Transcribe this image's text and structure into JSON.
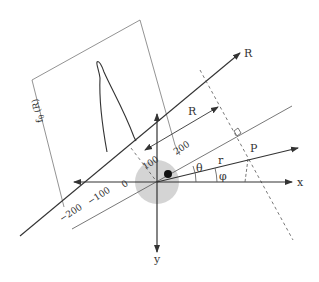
{
  "diagram": {
    "axes": {
      "x_label": "x",
      "y_label": "y",
      "R_label": "R"
    },
    "inset_plot": {
      "ylabel": "f_θ (R)",
      "ylabel_main": "f",
      "ylabel_sub": "θ",
      "ylabel_arg": " (R)",
      "ticks": [
        "−200",
        "−100",
        "0",
        "100",
        "200"
      ]
    },
    "annotations": {
      "R_distance": "R",
      "theta": "θ",
      "phi": "φ",
      "r": "r",
      "point": "P"
    },
    "colors": {
      "line": "#333333",
      "thin_line": "#555555",
      "shade": "#d4d4d4",
      "dot": "#111111"
    }
  }
}
